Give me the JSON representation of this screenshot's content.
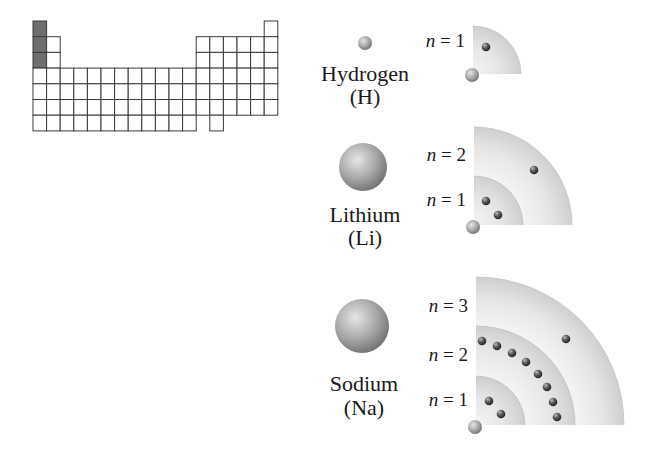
{
  "periodic_table": {
    "origin": [
      33,
      21
    ],
    "cell_w": 13.6,
    "cell_h": 15.7,
    "highlight_color": "#6e6e6e",
    "grid_color": "#3a3a3a",
    "highlighted_cells": [
      [
        1,
        1
      ],
      [
        2,
        1
      ],
      [
        3,
        1
      ]
    ],
    "rows": [
      [
        1,
        18
      ],
      [
        1,
        2,
        13,
        14,
        15,
        16,
        17,
        18
      ],
      [
        1,
        2,
        13,
        14,
        15,
        16,
        17,
        18
      ],
      [
        1,
        2,
        3,
        4,
        5,
        6,
        7,
        8,
        9,
        10,
        11,
        12,
        13,
        14,
        15,
        16,
        17,
        18
      ],
      [
        1,
        2,
        3,
        4,
        5,
        6,
        7,
        8,
        9,
        10,
        11,
        12,
        13,
        14,
        15,
        16,
        17,
        18
      ],
      [
        1,
        2,
        3,
        4,
        5,
        6,
        7,
        8,
        9,
        10,
        11,
        12,
        13,
        14,
        15,
        16,
        17,
        18
      ],
      [
        1,
        2,
        3,
        4,
        5,
        6,
        7,
        8,
        9,
        10,
        11,
        12,
        14
      ]
    ]
  },
  "atoms": [
    {
      "id": "hydrogen",
      "name": "Hydrogen",
      "symbol": "(H)",
      "sphere": {
        "cx": 365,
        "cy": 43,
        "r": 7
      },
      "name_pos": [
        365,
        81
      ],
      "symbol_pos": [
        365,
        104
      ],
      "corner": [
        473,
        74
      ],
      "shells": [
        {
          "n": "1",
          "radius": 48,
          "label_y": 47
        }
      ],
      "electrons": [
        [
          486,
          47
        ]
      ],
      "nucleus": {
        "cx": 472,
        "cy": 75,
        "r": 7
      }
    },
    {
      "id": "lithium",
      "name": "Lithium",
      "symbol": "(Li)",
      "sphere": {
        "cx": 363,
        "cy": 167,
        "r": 24
      },
      "name_pos": [
        365,
        222
      ],
      "symbol_pos": [
        365,
        245
      ],
      "corner": [
        474,
        225
      ],
      "shells": [
        {
          "n": "2",
          "radius": 98,
          "label_y": 161
        },
        {
          "n": "1",
          "radius": 49,
          "label_y": 206
        }
      ],
      "electrons": [
        [
          534,
          170
        ],
        [
          486,
          201
        ],
        [
          498,
          215
        ]
      ],
      "nucleus": {
        "cx": 473,
        "cy": 227,
        "r": 7
      }
    },
    {
      "id": "sodium",
      "name": "Sodium",
      "symbol": "(Na)",
      "sphere": {
        "cx": 362,
        "cy": 326,
        "r": 27
      },
      "name_pos": [
        364,
        391
      ],
      "symbol_pos": [
        364,
        415
      ],
      "corner": [
        476,
        425
      ],
      "shells": [
        {
          "n": "3",
          "radius": 148,
          "label_y": 312
        },
        {
          "n": "2",
          "radius": 99,
          "label_y": 361
        },
        {
          "n": "1",
          "radius": 49,
          "label_y": 406
        }
      ],
      "electrons": [
        [
          566,
          339
        ],
        [
          482,
          341
        ],
        [
          497,
          346
        ],
        [
          512,
          353
        ],
        [
          526,
          362
        ],
        [
          538,
          374
        ],
        [
          547,
          387
        ],
        [
          553,
          402
        ],
        [
          557,
          417
        ],
        [
          489,
          401
        ],
        [
          501,
          414
        ]
      ],
      "nucleus": {
        "cx": 475,
        "cy": 427,
        "r": 7
      }
    }
  ],
  "labels": {
    "n_symbol": "n",
    "equals": " = "
  },
  "colors": {
    "shell_light": "#f4f4f4",
    "shell_dark": "#cfcfcf",
    "electron": "#4a4a4a",
    "sphere_light": "#d8d8d8",
    "sphere_dark": "#7a7a7a"
  }
}
